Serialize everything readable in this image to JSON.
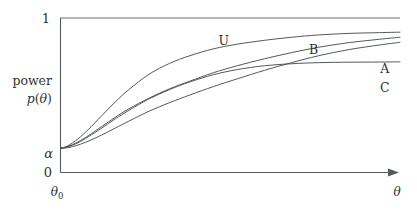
{
  "chart_data": {
    "type": "line",
    "title": "",
    "xlabel": "θ",
    "ylabel": "power p(θ)",
    "ylabel_line1": "power",
    "ylabel_line2": "p(θ)",
    "xlim_label_start": "θ₀",
    "ylim": [
      0,
      1
    ],
    "y_tick_labels": [
      "0",
      "α",
      "1"
    ],
    "y_tick_values": [
      0,
      0.155,
      1
    ],
    "x_tick_labels": [
      "θ₀"
    ],
    "grid": false,
    "legend_position": "inline-at-curve-ends",
    "axis_style": "two-axis-box-with-top-line",
    "arrow_on_x_axis": true,
    "alpha_level": 0.155,
    "series": [
      {
        "name": "U",
        "label": "U",
        "label_x": 0.48,
        "label_y": 0.85,
        "color": "#4a4f54",
        "x": [
          0.0,
          0.02,
          0.05,
          0.08,
          0.12,
          0.16,
          0.2,
          0.26,
          0.32,
          0.38,
          0.45,
          0.52,
          0.6,
          0.68,
          0.76,
          0.85,
          0.94,
          1.0
        ],
        "y": [
          0.155,
          0.17,
          0.215,
          0.275,
          0.365,
          0.455,
          0.535,
          0.635,
          0.705,
          0.755,
          0.8,
          0.83,
          0.855,
          0.875,
          0.89,
          0.9,
          0.905,
          0.908
        ]
      },
      {
        "name": "B",
        "label": "B",
        "label_x": 0.745,
        "label_y": 0.795,
        "color": "#4a4f54",
        "x": [
          0.0,
          0.02,
          0.05,
          0.08,
          0.12,
          0.16,
          0.2,
          0.26,
          0.32,
          0.38,
          0.45,
          0.52,
          0.6,
          0.68,
          0.76,
          0.85,
          0.94,
          1.0
        ],
        "y": [
          0.155,
          0.165,
          0.195,
          0.235,
          0.295,
          0.355,
          0.41,
          0.48,
          0.54,
          0.59,
          0.645,
          0.69,
          0.735,
          0.775,
          0.81,
          0.84,
          0.862,
          0.875
        ]
      },
      {
        "name": "A",
        "label": "A",
        "label_x": 0.955,
        "label_y": 0.67,
        "color": "#4a4f54",
        "x": [
          0.0,
          0.02,
          0.05,
          0.08,
          0.12,
          0.16,
          0.2,
          0.26,
          0.32,
          0.38,
          0.45,
          0.52,
          0.6,
          0.68,
          0.76,
          0.85,
          0.94,
          1.0
        ],
        "y": [
          0.155,
          0.158,
          0.175,
          0.2,
          0.24,
          0.285,
          0.33,
          0.395,
          0.45,
          0.5,
          0.555,
          0.605,
          0.66,
          0.71,
          0.755,
          0.795,
          0.825,
          0.842
        ]
      },
      {
        "name": "C",
        "label": "C",
        "label_x": 0.955,
        "label_y": 0.545,
        "color": "#4a4f54",
        "x": [
          0.0,
          0.02,
          0.05,
          0.08,
          0.12,
          0.16,
          0.2,
          0.26,
          0.32,
          0.38,
          0.45,
          0.52,
          0.6,
          0.68,
          0.76,
          0.85,
          0.94,
          1.0
        ],
        "y": [
          0.155,
          0.163,
          0.19,
          0.228,
          0.285,
          0.345,
          0.4,
          0.475,
          0.535,
          0.585,
          0.632,
          0.665,
          0.69,
          0.703,
          0.71,
          0.713,
          0.714,
          0.715
        ]
      }
    ],
    "annotations": [
      {
        "text": "1",
        "role": "y-max-tick"
      },
      {
        "text": "0",
        "role": "y-zero-tick"
      },
      {
        "text": "α",
        "role": "y-alpha-tick"
      },
      {
        "text": "θ₀",
        "role": "x-origin-tick"
      },
      {
        "text": "θ",
        "role": "x-axis-label"
      }
    ]
  },
  "labels": {
    "y_top": "1",
    "y_zero": "0",
    "y_alpha": "α",
    "x_origin": "θ",
    "x_origin_sub": "0",
    "x_axis": "θ",
    "ylabel_power": "power",
    "ylabel_p": "p",
    "ylabel_theta": "θ",
    "curve_u": "U",
    "curve_b": "B",
    "curve_a": "A",
    "curve_c": "C"
  },
  "colors": {
    "curve": "#4a4f54",
    "axis": "#555a5e",
    "text": "#2f3336",
    "background": "#ffffff"
  }
}
